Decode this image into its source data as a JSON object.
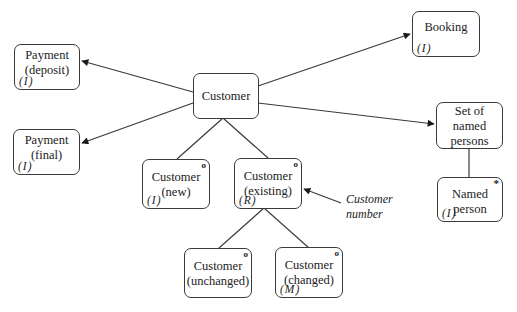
{
  "diagram": {
    "nodes": [
      {
        "id": "customer",
        "label": "Customer",
        "tag": "",
        "mark": ""
      },
      {
        "id": "payment-deposit",
        "label": "Payment\n(deposit)",
        "tag": "(I)",
        "mark": ""
      },
      {
        "id": "payment-final",
        "label": "Payment\n(final)",
        "tag": "(I)",
        "mark": ""
      },
      {
        "id": "booking",
        "label": "Booking",
        "tag": "(I)",
        "mark": ""
      },
      {
        "id": "set-named-persons",
        "label": "Set of\nnamed\npersons",
        "tag": "",
        "mark": ""
      },
      {
        "id": "named-person",
        "label": "Named\nperson",
        "tag": "(I)",
        "mark": "*"
      },
      {
        "id": "customer-new",
        "label": "Customer\n(new)",
        "tag": "(I)",
        "mark": "o"
      },
      {
        "id": "customer-existing",
        "label": "Customer\n(existing)",
        "tag": "(R)",
        "mark": "o"
      },
      {
        "id": "customer-unchanged",
        "label": "Customer\n(unchanged)",
        "tag": "",
        "mark": "o"
      },
      {
        "id": "customer-changed",
        "label": "Customer\n(changed)",
        "tag": "(M)",
        "mark": "o"
      }
    ],
    "annotations": [
      {
        "id": "customer-number",
        "text": "Customer\nnumber"
      }
    ],
    "edges": [
      {
        "from": "customer",
        "to": "payment-deposit",
        "arrow": true
      },
      {
        "from": "customer",
        "to": "payment-final",
        "arrow": true
      },
      {
        "from": "customer",
        "to": "booking",
        "arrow": true
      },
      {
        "from": "customer",
        "to": "set-named-persons",
        "arrow": true
      },
      {
        "from": "customer",
        "to": "customer-new",
        "arrow": false
      },
      {
        "from": "customer",
        "to": "customer-existing",
        "arrow": false
      },
      {
        "from": "customer-existing",
        "to": "customer-unchanged",
        "arrow": false
      },
      {
        "from": "customer-existing",
        "to": "customer-changed",
        "arrow": false
      },
      {
        "from": "set-named-persons",
        "to": "named-person",
        "arrow": false
      },
      {
        "from": "customer-number",
        "to": "customer-existing",
        "arrow": true
      }
    ]
  }
}
